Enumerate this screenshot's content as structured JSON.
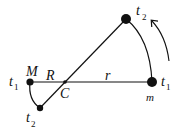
{
  "diagram": {
    "labels": {
      "M": "M",
      "m": "m",
      "R": "R",
      "r": "r",
      "C": "C",
      "t1_left": "t",
      "t1_left_sub": "1",
      "t1_right": "t",
      "t1_right_sub": "1",
      "t2_top": "t",
      "t2_top_sub": "2",
      "t2_bottom": "t",
      "t2_bottom_sub": "2"
    },
    "points": {
      "M_t1": [
        30,
        82
      ],
      "C": [
        65,
        82
      ],
      "m_t1": [
        152,
        82
      ],
      "m_t2": [
        126,
        19
      ],
      "M_t2": [
        40,
        108
      ]
    },
    "colors": {
      "ink": "#111111",
      "background": "#ffffff"
    }
  }
}
